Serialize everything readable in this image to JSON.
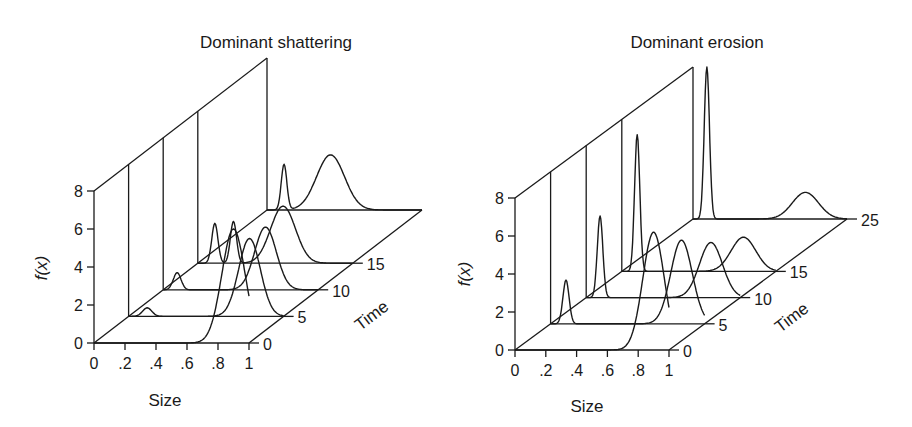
{
  "chart_data": [
    {
      "type": "waterfall-3d-line",
      "title": "Dominant shattering",
      "xlabel": "Size",
      "ylabel": "f(x)",
      "zlabel": "Time",
      "x_ticks": [
        "0",
        ".2",
        ".4",
        ".6",
        ".8",
        "1"
      ],
      "y_ticks": [
        "0",
        "2",
        "4",
        "6",
        "8"
      ],
      "time_ticks": [
        "0",
        "5",
        "10",
        "15"
      ],
      "xlim": [
        0,
        1
      ],
      "ylim": [
        0,
        8
      ],
      "time_slices": [
        0,
        5,
        10,
        15,
        25
      ],
      "series": [
        {
          "time": 0,
          "peaks": [
            {
              "x": 0.9,
              "height": 6.0,
              "width": 0.075
            }
          ]
        },
        {
          "time": 5,
          "peaks": [
            {
              "x": 0.12,
              "height": 0.45,
              "width": 0.03
            },
            {
              "x": 0.78,
              "height": 4.1,
              "width": 0.07
            }
          ]
        },
        {
          "time": 10,
          "peaks": [
            {
              "x": 0.09,
              "height": 0.9,
              "width": 0.025
            },
            {
              "x": 0.66,
              "height": 3.3,
              "width": 0.07
            }
          ]
        },
        {
          "time": 15,
          "peaks": [
            {
              "x": 0.11,
              "height": 2.1,
              "width": 0.02
            },
            {
              "x": 0.23,
              "height": 2.2,
              "width": 0.02
            },
            {
              "x": 0.55,
              "height": 3.0,
              "width": 0.08
            }
          ]
        },
        {
          "time": 25,
          "peaks": [
            {
              "x": 0.11,
              "height": 2.4,
              "width": 0.018
            },
            {
              "x": 0.41,
              "height": 2.9,
              "width": 0.09
            }
          ]
        }
      ]
    },
    {
      "type": "waterfall-3d-line",
      "title": "Dominant erosion",
      "xlabel": "Size",
      "ylabel": "f(x)",
      "zlabel": "Time",
      "x_ticks": [
        "0",
        ".2",
        ".4",
        ".6",
        ".8",
        "1"
      ],
      "y_ticks": [
        "0",
        "2",
        "4",
        "6",
        "8"
      ],
      "time_ticks": [
        "0",
        "5",
        "10",
        "15",
        "25"
      ],
      "xlim": [
        0,
        1
      ],
      "ylim": [
        0,
        8
      ],
      "time_slices": [
        0,
        5,
        10,
        15,
        25
      ],
      "series": [
        {
          "time": 0,
          "peaks": [
            {
              "x": 0.9,
              "height": 6.2,
              "width": 0.07
            }
          ]
        },
        {
          "time": 5,
          "peaks": [
            {
              "x": 0.1,
              "height": 2.3,
              "width": 0.02
            },
            {
              "x": 0.85,
              "height": 4.4,
              "width": 0.07
            }
          ]
        },
        {
          "time": 10,
          "peaks": [
            {
              "x": 0.09,
              "height": 4.3,
              "width": 0.018
            },
            {
              "x": 0.81,
              "height": 2.9,
              "width": 0.075
            }
          ]
        },
        {
          "time": 15,
          "peaks": [
            {
              "x": 0.1,
              "height": 7.2,
              "width": 0.017
            },
            {
              "x": 0.79,
              "height": 1.8,
              "width": 0.08
            }
          ]
        },
        {
          "time": 25,
          "peaks": [
            {
              "x": 0.09,
              "height": 8.0,
              "width": 0.017
            },
            {
              "x": 0.73,
              "height": 1.4,
              "width": 0.085
            }
          ]
        }
      ]
    }
  ],
  "panels": [
    {
      "title": "Dominant shattering",
      "xlabel": "Size",
      "ylabel": "f(x)",
      "zlabel": "Time"
    },
    {
      "title": "Dominant erosion",
      "xlabel": "Size",
      "ylabel": "f(x)",
      "zlabel": "Time"
    }
  ],
  "style": {
    "ink": "#1a1a1a",
    "background": "#ffffff"
  }
}
